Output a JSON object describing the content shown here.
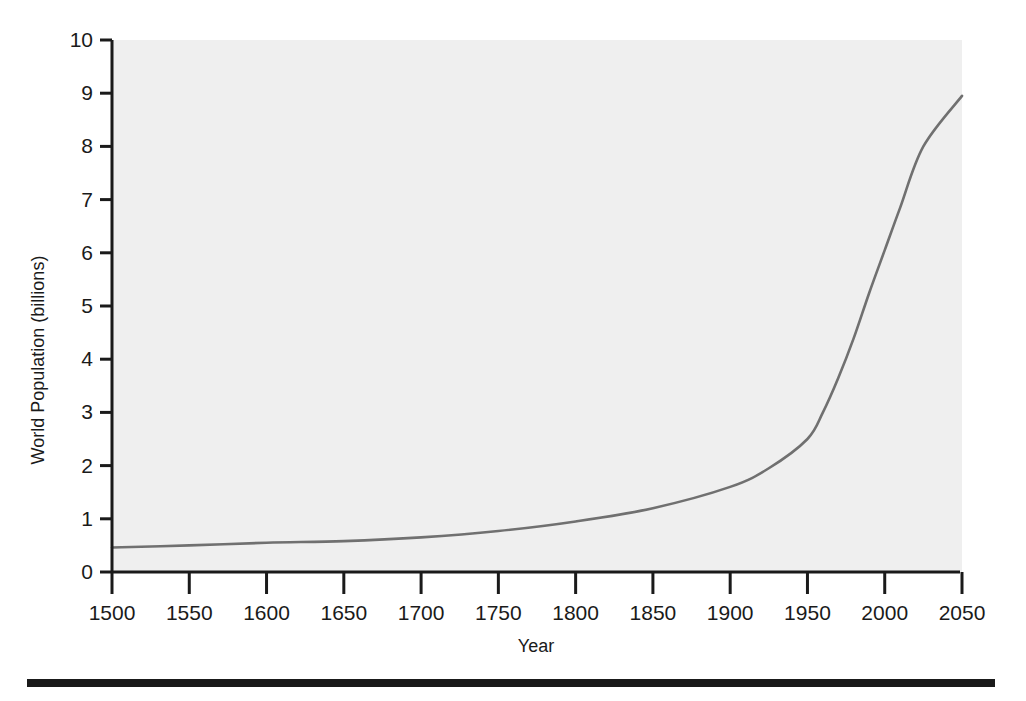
{
  "figure": {
    "background_color": "#ffffff",
    "plot_background_color": "#efefef",
    "axis_color": "#1a1a1a",
    "rule_color": "#1a1a1a",
    "xlabel": "Year",
    "ylabel": "World Population (billions)"
  },
  "chart_data": {
    "type": "line",
    "title": "",
    "subtitle": "",
    "xlabel": "Year",
    "ylabel": "World Population (billions)",
    "xlim": [
      1500,
      2050
    ],
    "ylim": [
      0,
      10
    ],
    "xticks": [
      1500,
      1550,
      1600,
      1650,
      1700,
      1750,
      1800,
      1850,
      1900,
      1950,
      2000,
      2050
    ],
    "yticks": [
      0,
      1,
      2,
      3,
      4,
      5,
      6,
      7,
      8,
      9,
      10
    ],
    "xtick_labels": [
      "1500",
      "1550",
      "1600",
      "1650",
      "1700",
      "1750",
      "1800",
      "1850",
      "1900",
      "1950",
      "2000",
      "2050"
    ],
    "ytick_labels": [
      "0",
      "1",
      "2",
      "3",
      "4",
      "5",
      "6",
      "7",
      "8",
      "9",
      "10"
    ],
    "grid": false,
    "legend": false,
    "legend_position": "none",
    "line_color": "#707070",
    "line_width": 2.6,
    "series": [
      {
        "name": "World Population",
        "x": [
          1500,
          1550,
          1600,
          1650,
          1700,
          1750,
          1800,
          1850,
          1900,
          1925,
          1950,
          1960,
          1970,
          1980,
          1990,
          2000,
          2010,
          2025,
          2050
        ],
        "values": [
          0.46,
          0.5,
          0.55,
          0.58,
          0.65,
          0.77,
          0.95,
          1.2,
          1.6,
          1.95,
          2.5,
          3.0,
          3.65,
          4.4,
          5.25,
          6.05,
          6.85,
          8.0,
          8.95
        ]
      }
    ]
  },
  "bottom_rule": {
    "name": "horizontal-rule",
    "x": 27,
    "y": 679,
    "width": 968,
    "height": 8
  }
}
